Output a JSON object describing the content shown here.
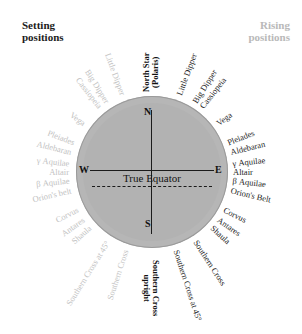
{
  "headings": {
    "setting": "Setting\npositions",
    "rising": "Rising\npositions"
  },
  "center": {
    "equator_label": "True Equator",
    "cardinals": {
      "north": "N",
      "south": "S",
      "east": "E",
      "west": "W"
    }
  },
  "polar_label": "North Star\n(Polaris)",
  "colors": {
    "disc_fill": "#b6b6b6",
    "setting_text": "#1d1d1d",
    "rising_text": "#c2c2c2",
    "tick": "#1b1b1b",
    "axis": "#1b1b1b",
    "background": "#ffffff"
  },
  "setting_labels": [
    {
      "text": "Little Dipper",
      "angle": -70
    },
    {
      "text": "Big Dipper",
      "angle": -58
    },
    {
      "text": "Cassiopeia",
      "angle": -52
    },
    {
      "text": "Vega",
      "angle": -36
    },
    {
      "text": "Pleiades",
      "angle": -21
    },
    {
      "text": "Aldebaran",
      "angle": -14
    },
    {
      "text": "γ Aquilae",
      "angle": -6
    },
    {
      "text": "Altair",
      "angle": 0
    },
    {
      "text": "β Aquilae",
      "angle": 6
    },
    {
      "text": "Orion's Belt",
      "angle": 13
    },
    {
      "text": "Corvus",
      "angle": 27
    },
    {
      "text": "Antares",
      "angle": 35
    },
    {
      "text": "Shaula",
      "angle": 42
    },
    {
      "text": "Southern Cross",
      "angle": 57
    },
    {
      "text": "Southern Cross at 45°",
      "angle": 72
    }
  ],
  "rising_labels": [
    {
      "text": "Little Dipper",
      "angle": -110
    },
    {
      "text": "Big Dipper",
      "angle": -122
    },
    {
      "text": "Cassiopeia",
      "angle": -128
    },
    {
      "text": "Vega",
      "angle": -144
    },
    {
      "text": "Pleiades",
      "angle": -159
    },
    {
      "text": "Aldebaran",
      "angle": -166
    },
    {
      "text": "γ Aquilae",
      "angle": -174
    },
    {
      "text": "Altair",
      "angle": 180
    },
    {
      "text": "β Aquilae",
      "angle": 174
    },
    {
      "text": "Orion's belt",
      "angle": 167
    },
    {
      "text": "Corvus",
      "angle": 153
    },
    {
      "text": "Antares",
      "angle": 145
    },
    {
      "text": "Shaula",
      "angle": 138
    },
    {
      "text": "Southern Cross at 45°",
      "angle": 122
    },
    {
      "text": "Southern Cross",
      "angle": 108
    }
  ],
  "bottom_label": {
    "text": "Southern Cross\nupright",
    "angle": 90
  },
  "tick_angles_deg": [
    -90,
    -83,
    -76,
    -70,
    -62,
    -56,
    -50,
    -42,
    -36,
    -27,
    -21,
    -14,
    -8,
    -4,
    0,
    4,
    8,
    14,
    21,
    27,
    36,
    42,
    50,
    56,
    62,
    70,
    76,
    83,
    90,
    97,
    104,
    110,
    118,
    124,
    130,
    138,
    144,
    153,
    159,
    166,
    172,
    176,
    180,
    -176,
    -172,
    -166,
    -159,
    -153,
    -144,
    -138,
    -130,
    -124,
    -118,
    -110,
    -97
  ]
}
